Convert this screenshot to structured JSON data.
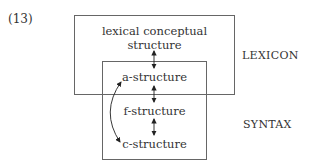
{
  "example_number": "(13)",
  "diagram": {
    "outer_box_label": "LEXICON",
    "inner_box_label": "SYNTAX",
    "nodes": [
      {
        "id": "lcs",
        "line1": "lexical conceptual",
        "line2": "structure"
      },
      {
        "id": "a",
        "label": "a-structure"
      },
      {
        "id": "f",
        "label": "f-structure"
      },
      {
        "id": "c",
        "label": "c-structure"
      }
    ],
    "edges": [
      {
        "from": "lcs",
        "to": "a",
        "type": "bidirectional"
      },
      {
        "from": "a",
        "to": "f",
        "type": "bidirectional"
      },
      {
        "from": "f",
        "to": "c",
        "type": "bidirectional"
      },
      {
        "from": "a",
        "to": "c",
        "type": "bidirectional-curved"
      }
    ]
  }
}
